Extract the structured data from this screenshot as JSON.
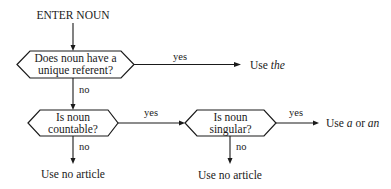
{
  "diagram": {
    "type": "flowchart",
    "start": {
      "label": "ENTER NOUN"
    },
    "decisions": [
      {
        "id": "d1",
        "line1": "Does noun have a",
        "line2": "unique referent?"
      },
      {
        "id": "d2",
        "line1": "Is noun",
        "line2": "countable?"
      },
      {
        "id": "d3",
        "line1": "Is noun",
        "line2": "singular?"
      }
    ],
    "edges": {
      "d1_yes": "yes",
      "d1_no": "no",
      "d2_yes": "yes",
      "d2_no": "no",
      "d3_yes": "yes",
      "d3_no": "no"
    },
    "outcomes": {
      "use_the": {
        "prefix": "Use ",
        "article": "the"
      },
      "use_a_an": {
        "prefix": "Use ",
        "article1": "a",
        "middle": " or ",
        "article2": "an"
      },
      "no_article_1": {
        "label": "Use no article"
      },
      "no_article_2": {
        "label": "Use no article"
      }
    }
  }
}
